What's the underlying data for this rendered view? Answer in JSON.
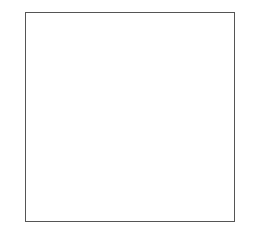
{
  "chart_data": {
    "type": "heatmap",
    "columns": 25,
    "rows": 50,
    "colors": {
      "dark": "#6e6e6e",
      "light": "#ffffff",
      "grid": "#bdbdbd"
    },
    "left_row_labels": [
      "50",
      "48",
      "46",
      "44",
      "42",
      "40",
      "38",
      "36",
      "34",
      "32",
      "30",
      "28",
      "26",
      "24",
      "22",
      "20",
      "18",
      "16",
      "14",
      "12",
      "10",
      "8",
      "6",
      "4",
      "2→"
    ],
    "right_row_labels": [
      "49",
      "47",
      "45",
      "43",
      "41",
      "39",
      "37",
      "35",
      "33",
      "31",
      "29",
      "27",
      "25",
      "23",
      "21",
      "19",
      "17",
      "15",
      "13",
      "11",
      "9",
      "7",
      "5",
      "3",
      "←1"
    ],
    "bottom_col_labels": [
      {
        "label": "25",
        "col": 25
      },
      {
        "label": "20",
        "col": 20
      },
      {
        "label": "15",
        "col": 15
      },
      {
        "label": "10",
        "col": 10
      },
      {
        "label": "5",
        "col": 5
      },
      {
        "label": "1",
        "col": 1
      }
    ],
    "grid_top_to_bottom_col25_to_col1": [
      "0000000000000000000000000",
      "1101010101010101010101011",
      "0000000000000000000000000",
      "1101011110101010111101011",
      "0000010010000000100100000",
      "1101011010101010110101011",
      "0000011110000000110100000",
      "1101011011101010110101011",
      "0000010010000000110100000",
      "1101011011101010110101011",
      "0000011011110000110100000",
      "1101011010111010110101011",
      "0000011010011000110100000",
      "1101011010101110110101011",
      "0000011010001110110100000",
      "1101011010101011110101011",
      "0000011010000011110100000",
      "1101011010101011110101011",
      "0000011010000001110100000",
      "1101011010101010110101011",
      "0000011010000000110100000",
      "1101011010111010110101011",
      "0000011010011100110100000",
      "1101011010101111110101011",
      "0000011010000111110100000",
      "1101011010101011110101011",
      "0000011010000001110100000",
      "1101011010101010110101011",
      "0000011010000000110100000",
      "1101011010101010110101011",
      "0000011010000000110100000",
      "1101011010101010110101011",
      "0000011010000000110100000",
      "1101011010101010110101011",
      "0000011010000000110100000",
      "1101011010101010110101011",
      "0000011010000000110100000",
      "1101011010101010110101011",
      "0000011010000000110100000",
      "1101011010101010110101011",
      "0000011010000000110100000",
      "1101011110101010111101011",
      "0000010010000000100100000",
      "1101011110101010111101011",
      "0000000000000000000000000",
      "1101010101010101010101011",
      "0000000000000000000000000",
      "1101010101010101010101011",
      "0000000000000000000000000",
      "0000000000000000000000000"
    ]
  }
}
